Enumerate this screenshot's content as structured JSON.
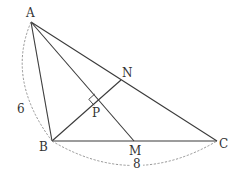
{
  "diagram": {
    "type": "geometry",
    "points": {
      "A": {
        "label": "A",
        "x": 31,
        "y": 22
      },
      "B": {
        "label": "B",
        "x": 52,
        "y": 141
      },
      "C": {
        "label": "C",
        "x": 217,
        "y": 141
      },
      "M": {
        "label": "M",
        "x": 134,
        "y": 141
      },
      "N": {
        "label": "N",
        "x": 121,
        "y": 80
      },
      "P": {
        "label": "P",
        "x": 100,
        "y": 100
      }
    },
    "segments": [
      {
        "name": "AB",
        "from": "A",
        "to": "B"
      },
      {
        "name": "BC",
        "from": "B",
        "to": "C"
      },
      {
        "name": "CA",
        "from": "C",
        "to": "A"
      },
      {
        "name": "AM",
        "from": "A",
        "to": "M"
      },
      {
        "name": "BN",
        "from": "B",
        "to": "N"
      }
    ],
    "lengths": {
      "AB": "6",
      "BC": "8"
    },
    "right_angle_at": "P",
    "colors": {
      "line": "#3a3a3a",
      "dashed_arc": "#8a8a8a",
      "text": "#333333",
      "background": "#ffffff"
    }
  }
}
